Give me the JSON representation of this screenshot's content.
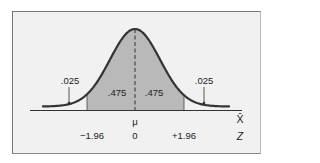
{
  "chart_data": {
    "type": "area",
    "title": "",
    "xlabel": "X̄",
    "zlabel": "Z",
    "mean_label": "μ",
    "z_ticks": [
      "−1.96",
      "0",
      "+1.96"
    ],
    "regions": [
      {
        "name": "left-tail",
        "from": "-inf",
        "to": -1.96,
        "area": ".025",
        "shaded": false
      },
      {
        "name": "left-center",
        "from": -1.96,
        "to": 0,
        "area": ".475",
        "shaded": true
      },
      {
        "name": "right-center",
        "from": 0,
        "to": 1.96,
        "area": ".475",
        "shaded": true
      },
      {
        "name": "right-tail",
        "from": 1.96,
        "to": "inf",
        "area": ".025",
        "shaded": false
      }
    ],
    "colors": {
      "shade": "#b9b9b9",
      "curve": "#333333",
      "background": "#f1f1f1"
    }
  },
  "labels": {
    "left_tail": ".025",
    "right_tail": ".025",
    "left_center": ".475",
    "right_center": ".475",
    "mu": "μ",
    "xbar": "X̄",
    "z": "Z",
    "z_neg": "−1.96",
    "z_zero": "0",
    "z_pos": "+1.96"
  }
}
